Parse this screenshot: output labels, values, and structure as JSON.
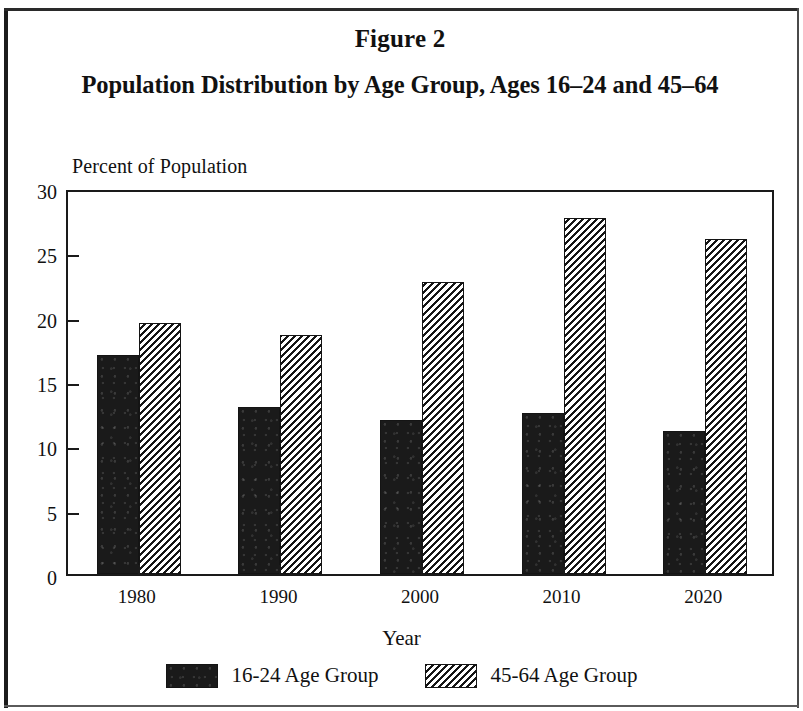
{
  "figure": {
    "number_label": "Figure 2",
    "title": "Population Distribution by Age Group, Ages 16–24 and 45–64"
  },
  "chart_data": {
    "type": "bar",
    "title": "Population Distribution by Age Group, Ages 16–24 and 45–64",
    "subtitle": "Figure 2",
    "xlabel": "Year",
    "ylabel": "Percent of Population",
    "categories": [
      "1980",
      "1990",
      "2000",
      "2010",
      "2020"
    ],
    "series": [
      {
        "name": "16-24 Age Group",
        "values": [
          17.0,
          13.0,
          12.0,
          12.5,
          11.1
        ],
        "fill": "solid-black",
        "color": "#1a1a1a"
      },
      {
        "name": "45-64 Age Group",
        "values": [
          19.5,
          18.6,
          22.7,
          27.7,
          26.0
        ],
        "fill": "diagonal-hatch",
        "color": "#151515"
      }
    ],
    "ylim": [
      0,
      30
    ],
    "ytick_labels": [
      "30",
      "25",
      "20",
      "15",
      "10",
      "5",
      "0"
    ],
    "ytick_values": [
      30,
      25,
      20,
      15,
      10,
      5,
      0
    ],
    "grid": false,
    "legend_position": "bottom"
  },
  "axes": {
    "y_axis_caption": "Percent of Population",
    "x_axis_caption": "Year"
  },
  "legend": {
    "entries": [
      {
        "label": "16-24 Age Group",
        "swatch": "solid-black-swatch"
      },
      {
        "label": "45-64 Age Group",
        "swatch": "diagonal-hatch-swatch"
      }
    ]
  },
  "colors": {
    "ink": "#1a1a1a",
    "paper": "#ffffff",
    "series_1": "#1a1a1a",
    "series_2": "#151515"
  }
}
